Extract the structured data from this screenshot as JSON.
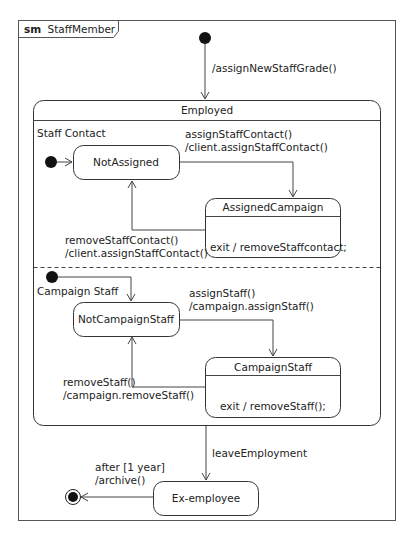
{
  "diagram": {
    "kind": "sm",
    "name": "StaffMember",
    "initial_transition_label": "/assignNewStaffGrade()",
    "composite_state": {
      "name": "Employed",
      "regions": [
        {
          "name": "Staff Contact",
          "states": [
            {
              "id": "not-assigned",
              "name": "NotAssigned"
            },
            {
              "id": "assigned-campaign",
              "name": "AssignedCampaign",
              "internal": "exit / removeStaffcontact;"
            }
          ],
          "transitions": [
            {
              "from": "not-assigned",
              "to": "assigned-campaign",
              "trigger": "assignStaffContact()",
              "effect": "/client.assignStaffContact()"
            },
            {
              "from": "assigned-campaign",
              "to": "not-assigned",
              "trigger": "removeStaffContact()",
              "effect": "/client.assignStaffContact()"
            }
          ]
        },
        {
          "name": "Campaign Staff",
          "states": [
            {
              "id": "not-campaign-staff",
              "name": "NotCampaignStaff"
            },
            {
              "id": "campaign-staff",
              "name": "CampaignStaff",
              "internal": "exit / removeStaff();"
            }
          ],
          "transitions": [
            {
              "from": "not-campaign-staff",
              "to": "campaign-staff",
              "trigger": "assignStaff()",
              "effect": "/campaign.assignStaff()"
            },
            {
              "from": "campaign-staff",
              "to": "not-campaign-staff",
              "trigger": "removeStaff()",
              "effect": "/campaign.removeStaff()"
            }
          ]
        }
      ]
    },
    "leave_transition_label": "leaveEmployment",
    "ex_state": {
      "name": "Ex-employee"
    },
    "final_transition": {
      "trigger": "after [1 year]",
      "effect": "/archive()"
    }
  }
}
